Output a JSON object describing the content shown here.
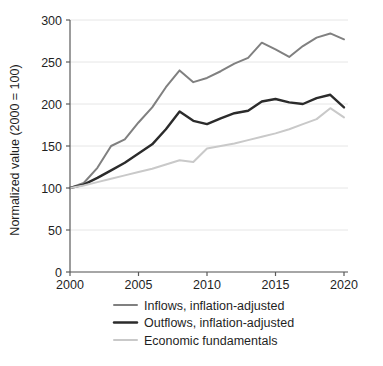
{
  "chart_data": {
    "type": "line",
    "title": "",
    "xlabel": "",
    "ylabel": "Normalized value (2000 = 100)",
    "xlim": [
      2000,
      2020
    ],
    "ylim": [
      0,
      300
    ],
    "grid": true,
    "legend_position": "below",
    "x_ticks": [
      "2000",
      "2005",
      "2010",
      "2015",
      "2020"
    ],
    "x_tick_values": [
      2000,
      2005,
      2010,
      2015,
      2020
    ],
    "y_ticks": [
      "0",
      "50",
      "100",
      "150",
      "200",
      "250",
      "300"
    ],
    "y_tick_values": [
      0,
      50,
      100,
      150,
      200,
      250,
      300
    ],
    "x": [
      2000,
      2001,
      2002,
      2003,
      2004,
      2005,
      2006,
      2007,
      2008,
      2009,
      2010,
      2011,
      2012,
      2013,
      2014,
      2015,
      2016,
      2017,
      2018,
      2019,
      2020
    ],
    "series": [
      {
        "name": "Inflows, inflation-adjusted",
        "color": "#808080",
        "width": 2.0,
        "values": [
          100,
          106,
          124,
          150,
          158,
          178,
          196,
          220,
          240,
          226,
          231,
          239,
          248,
          255,
          273,
          265,
          256,
          269,
          279,
          284,
          277
        ]
      },
      {
        "name": "Outflows, inflation-adjusted",
        "color": "#2b2b2b",
        "width": 2.4,
        "values": [
          100,
          104,
          112,
          121,
          130,
          141,
          152,
          170,
          191,
          180,
          176,
          183,
          189,
          192,
          203,
          206,
          202,
          200,
          207,
          211,
          196
        ]
      },
      {
        "name": "Economic fundamentals",
        "color": "#c9c9c9",
        "width": 2.0,
        "values": [
          100,
          103,
          107,
          111,
          115,
          119,
          123,
          128,
          133,
          131,
          147,
          150,
          153,
          157,
          161,
          165,
          170,
          176,
          182,
          195,
          184
        ]
      }
    ],
    "legend_entries": [
      {
        "label": "Inflows, inflation-adjusted",
        "color": "#808080"
      },
      {
        "label": "Outflows, inflation-adjusted",
        "color": "#2b2b2b"
      },
      {
        "label": "Economic fundamentals",
        "color": "#c9c9c9"
      }
    ]
  }
}
